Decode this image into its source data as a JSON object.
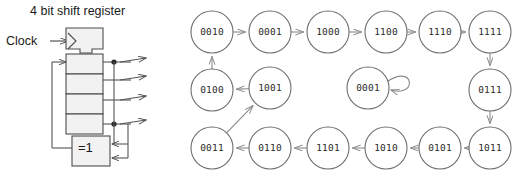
{
  "figure": {
    "panels": [
      {
        "name": "circuit",
        "title": "4 bit shift register"
      },
      {
        "name": "state-graph",
        "title": ""
      }
    ]
  },
  "circuit": {
    "title": "4 bit shift register",
    "clock_label": "Clock",
    "gate_label": "=1",
    "gate_name": "xor-gate",
    "stage_count": 4,
    "output_tap_count": 4,
    "clock_edge_icon": "clock-triangle-icon",
    "colors": {
      "line": "#555555",
      "box_fill": "#f2f2f2",
      "box_stroke": "#4d4d4d",
      "text": "#1a1a1a"
    }
  },
  "chart_data": {
    "type": "diagram",
    "subtype": "state-transition-graph",
    "node_shape": "circle",
    "node_label_format": "4-bit binary",
    "nodes": [
      {
        "id": "0010",
        "label": "0010",
        "cx": 40,
        "cy": 32
      },
      {
        "id": "0001",
        "label": "0001",
        "cx": 98,
        "cy": 32
      },
      {
        "id": "1000",
        "label": "1000",
        "cx": 156,
        "cy": 32
      },
      {
        "id": "1100",
        "label": "1100",
        "cx": 214,
        "cy": 32
      },
      {
        "id": "1110",
        "label": "1110",
        "cx": 268,
        "cy": 32
      },
      {
        "id": "1111",
        "label": "1111",
        "cx": 318,
        "cy": 32
      },
      {
        "id": "0100",
        "label": "0100",
        "cx": 40,
        "cy": 90
      },
      {
        "id": "1001",
        "label": "1001",
        "cx": 98,
        "cy": 88
      },
      {
        "id": "0001b",
        "label": "0001",
        "cx": 196,
        "cy": 88
      },
      {
        "id": "0111",
        "label": "0111",
        "cx": 318,
        "cy": 90
      },
      {
        "id": "0011",
        "label": "0011",
        "cx": 40,
        "cy": 148
      },
      {
        "id": "0110",
        "label": "0110",
        "cx": 98,
        "cy": 148
      },
      {
        "id": "1101",
        "label": "1101",
        "cx": 156,
        "cy": 148
      },
      {
        "id": "1010",
        "label": "1010",
        "cx": 214,
        "cy": 148
      },
      {
        "id": "0101",
        "label": "0101",
        "cx": 268,
        "cy": 148
      },
      {
        "id": "1011",
        "label": "1011",
        "cx": 318,
        "cy": 148
      }
    ],
    "edges": [
      {
        "from": "0010",
        "to": "0001"
      },
      {
        "from": "0001",
        "to": "1000"
      },
      {
        "from": "1000",
        "to": "1100"
      },
      {
        "from": "1100",
        "to": "1110"
      },
      {
        "from": "1110",
        "to": "1111"
      },
      {
        "from": "1111",
        "to": "0111"
      },
      {
        "from": "0111",
        "to": "1011"
      },
      {
        "from": "1011",
        "to": "0101"
      },
      {
        "from": "0101",
        "to": "1010"
      },
      {
        "from": "1010",
        "to": "1101"
      },
      {
        "from": "1101",
        "to": "0110"
      },
      {
        "from": "0110",
        "to": "0011"
      },
      {
        "from": "0011",
        "to": "1001"
      },
      {
        "from": "1001",
        "to": "0100"
      },
      {
        "from": "0100",
        "to": "0010"
      },
      {
        "from": "0001b",
        "to": "0001b",
        "self_loop": true
      }
    ],
    "cycle_length": 15,
    "isolated_self_loop_state": "0001",
    "colors": {
      "node_stroke": "#6e6e6e",
      "node_fill": "#ffffff",
      "edge": "#8a8a8a",
      "label": "#2b2b2b"
    }
  }
}
